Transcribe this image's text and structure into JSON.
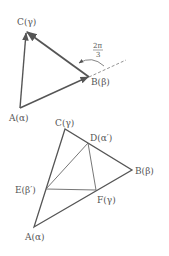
{
  "figure_top": {
    "labels": {
      "C": "C(γ)",
      "A": "A(α)",
      "B": "B(β)",
      "angle_num": "2π",
      "angle_den": "3"
    },
    "colors": {
      "stroke": "#555555",
      "thin": "#777777"
    }
  },
  "figure_bottom": {
    "labels": {
      "C": "C(γ)",
      "D": "D(α′)",
      "B": "B(β)",
      "E": "E(β′)",
      "F": "F(γ)",
      "A": "A(α)"
    }
  }
}
